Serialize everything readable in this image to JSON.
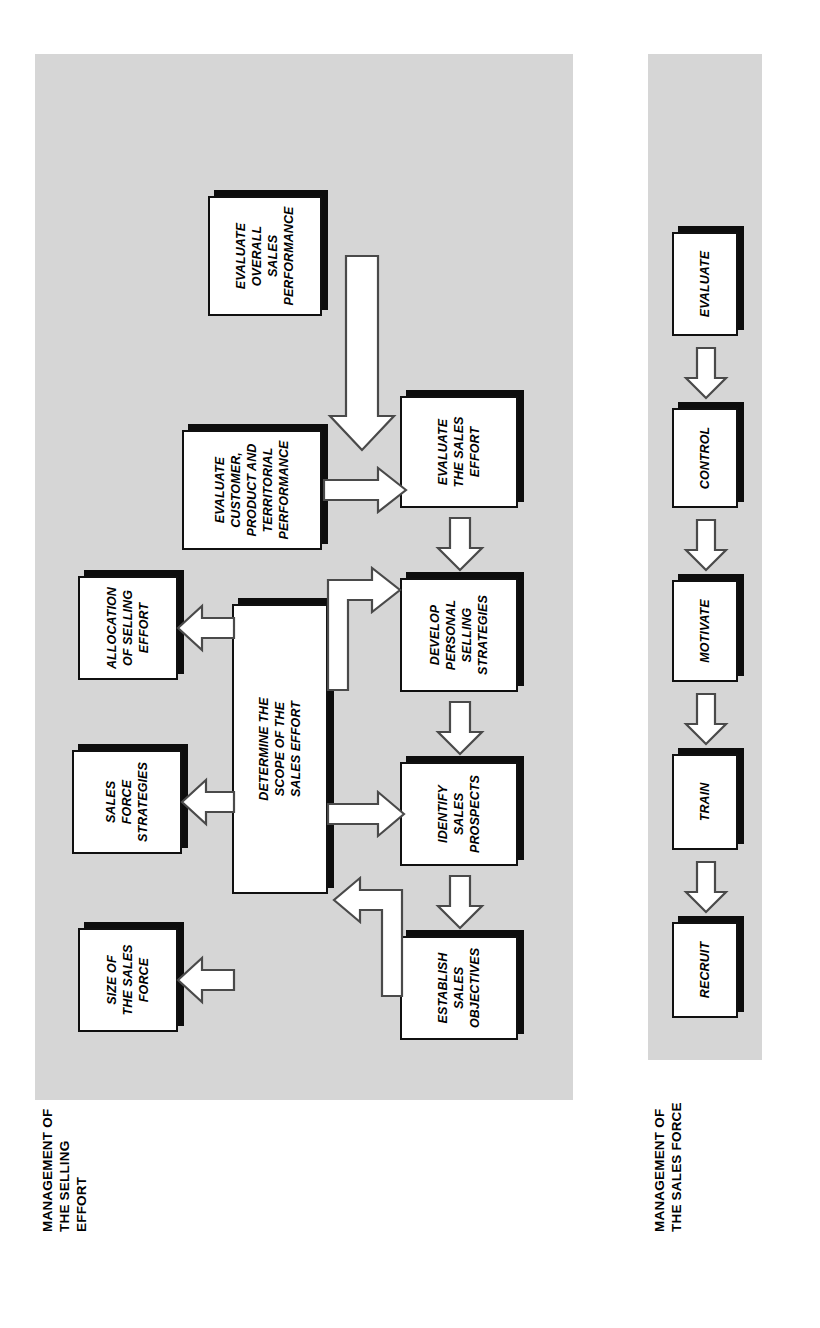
{
  "diagram": {
    "title_hidden": "",
    "background_color": "#ffffff",
    "panel_color": "#d6d6d6",
    "box_fill": "#ffffff",
    "box_border": "#101010",
    "shadow_color": "#0d0d0d",
    "arrow_stroke": "#4a4a4a"
  },
  "sections": [
    {
      "id": "selling-effort",
      "caption": "MANAGEMENT OF\nTHE SELLING\nEFFORT",
      "boxes": {
        "establish_sales_objectives": "ESTABLISH\nSALES\nOBJECTIVES",
        "identify_sales_prospects": "IDENTIFY\nSALES\nPROSPECTS",
        "develop_personal_selling_strategies": "DEVELOP\nPERSONAL\nSELLING\nSTRATEGIES",
        "evaluate_the_sales_effort": "EVALUATE\nTHE SALES\nEFFORT",
        "determine_scope": "DETERMINE THE\nSCOPE OF THE\nSALES EFFORT",
        "size_of_the_sales_force": "SIZE OF\nTHE SALES\nFORCE",
        "sales_force_strategies": "SALES\nFORCE\nSTRATEGIES",
        "allocation_of_selling_effort": "ALLOCATION\nOF SELLING\nEFFORT",
        "evaluate_customer_product_territorial": "EVALUATE\nCUSTOMER,\nPRODUCT AND\nTERRITORIAL\nPERFORMANCE",
        "evaluate_overall_sales_performance": "EVALUATE\nOVERALL\nSALES\nPERFORMANCE"
      }
    },
    {
      "id": "sales-force",
      "caption": "MANAGEMENT OF\nTHE SALES FORCE",
      "boxes": {
        "recruit": "RECRUIT",
        "train": "TRAIN",
        "motivate": "MOTIVATE",
        "control": "CONTROL",
        "evaluate": "EVALUATE"
      }
    }
  ],
  "flow": {
    "top_chain": [
      "ESTABLISH SALES OBJECTIVES",
      "IDENTIFY SALES PROSPECTS",
      "DEVELOP PERSONAL SELLING STRATEGIES",
      "EVALUATE THE SALES EFFORT"
    ],
    "bottom_chain": [
      "RECRUIT",
      "TRAIN",
      "MOTIVATE",
      "CONTROL",
      "EVALUATE"
    ],
    "into_determine_scope": [
      "SIZE OF THE SALES FORCE",
      "SALES FORCE STRATEGIES",
      "ALLOCATION OF SELLING EFFORT",
      "ESTABLISH SALES OBJECTIVES"
    ],
    "determine_scope_outputs": [
      "IDENTIFY SALES PROSPECTS",
      "DEVELOP PERSONAL SELLING STRATEGIES"
    ],
    "into_evaluate_effort": [
      "EVALUATE CUSTOMER, PRODUCT AND TERRITORIAL PERFORMANCE",
      "EVALUATE OVERALL SALES PERFORMANCE"
    ]
  }
}
